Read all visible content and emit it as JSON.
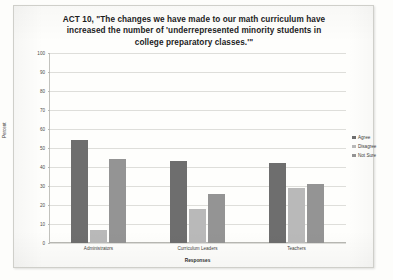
{
  "chart_data": {
    "type": "bar",
    "title": "ACT 10, \"The changes we have made to our math curriculum have increased the number of 'underrepresented minority students in college preparatory classes.'\"",
    "title_lines": [
      "ACT 10, \"The changes we have made to our math curriculum have",
      "increased the number of 'underrepresented minority students in",
      "college preparatory classes.'\""
    ],
    "xlabel": "Responses",
    "ylabel": "Percent",
    "categories": [
      "Administrators",
      "Curriculum Leaders",
      "Teachers"
    ],
    "series": [
      {
        "name": "Agree",
        "color": "#6e6e6e",
        "values": [
          54,
          43,
          42
        ]
      },
      {
        "name": "Disagree",
        "color": "#b9b9b9",
        "values": [
          7,
          18,
          29
        ]
      },
      {
        "name": "Not Sure",
        "color": "#949494",
        "values": [
          44,
          26,
          31
        ]
      }
    ],
    "ylim": [
      0,
      100
    ],
    "ytick_step": 10,
    "yticks": [
      0,
      10,
      20,
      30,
      40,
      50,
      60,
      70,
      80,
      90,
      100
    ],
    "ytick_labels": [
      "0",
      "10",
      "20",
      "30",
      "40",
      "50",
      "60",
      "70",
      "80",
      "90",
      "100"
    ],
    "grid": true,
    "legend_position": "right"
  }
}
